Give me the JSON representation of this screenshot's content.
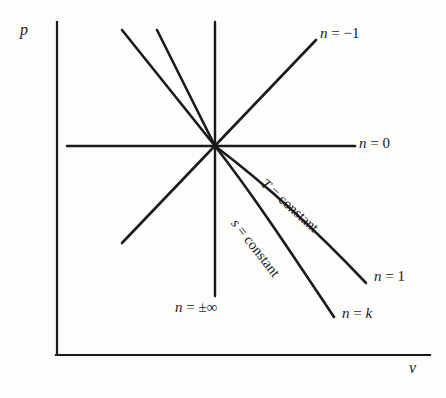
{
  "figure": {
    "type": "line-diagram",
    "background_color": "#fdfdfc",
    "line_color": "#1a1a1a"
  },
  "axes": {
    "y_label": "p",
    "x_label": "v",
    "y_axis": {
      "x": 57,
      "y_top": 22,
      "y_bottom": 355
    },
    "x_axis": {
      "y": 355,
      "x_left": 57,
      "x_right": 430
    }
  },
  "origin": {
    "x": 215,
    "y": 146
  },
  "lines": [
    {
      "name": "steepest-negative-slope-line",
      "x1": 122,
      "y1": 30,
      "x2": 215,
      "y2": 146
    },
    {
      "name": "steep-negative-slope-line",
      "x1": 157,
      "y1": 30,
      "x2": 215,
      "y2": 146
    },
    {
      "name": "vertical-line-n-infinity",
      "x1": 215,
      "y1": 22,
      "x2": 215,
      "y2": 296
    },
    {
      "name": "positive-slope-line-n-minus-1",
      "x1": 122,
      "y1": 243,
      "x2": 316,
      "y2": 40
    },
    {
      "name": "horizontal-line-n-0",
      "x1": 67,
      "y1": 146,
      "x2": 355,
      "y2": 146
    }
  ],
  "curves": [
    {
      "name": "isotherm-curve",
      "label": "T = constant",
      "end_label": "n = 1",
      "path": "M 215 146 C 268 186, 316 230, 366 283"
    },
    {
      "name": "isentrope-curve",
      "label": "s = constant",
      "end_label": "n = k",
      "path": "M 215 146 C 254 196, 292 254, 334 317"
    }
  ],
  "labels": {
    "n_minus_1": {
      "text_n": "n",
      "text_rest": " = −1",
      "x": 320,
      "y": 28
    },
    "n_0": {
      "text_n": "n",
      "text_rest": " = 0",
      "x": 359,
      "y": 137
    },
    "n_1": {
      "text_n": "n",
      "text_rest": " = 1",
      "x": 374,
      "y": 270
    },
    "n_k": {
      "text_n": "n",
      "text_rest": " = ",
      "text_k": "k",
      "x": 342,
      "y": 307
    },
    "n_infinity": {
      "text_n": "n",
      "text_rest": " = ±∞",
      "x": 175,
      "y": 300
    },
    "T_constant": {
      "text_T": "T",
      "text_rest": " = constant",
      "x": 268,
      "y": 176,
      "rotation": 42
    },
    "s_constant": {
      "text_s": "s",
      "text_rest": " = constant",
      "x": 240,
      "y": 216,
      "rotation": 52
    }
  }
}
